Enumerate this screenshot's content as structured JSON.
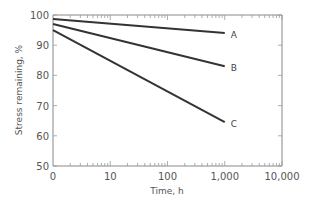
{
  "chart_data": {
    "type": "line",
    "title": "",
    "xlabel": "Time, h",
    "ylabel": "Stress remaining, %",
    "x_scale": "log",
    "x_tick_labels": [
      "0",
      "10",
      "100",
      "1,000",
      "10,000"
    ],
    "y_tick_labels": [
      "50",
      "60",
      "70",
      "80",
      "90",
      "100"
    ],
    "ylim": [
      50,
      100
    ],
    "grid": false,
    "legend": "inline labels at line ends",
    "series": [
      {
        "name": "A",
        "x": [
          1,
          1000
        ],
        "values": [
          98.7,
          94
        ]
      },
      {
        "name": "B",
        "x": [
          1,
          1000
        ],
        "values": [
          97,
          83
        ]
      },
      {
        "name": "C",
        "x": [
          1,
          1000
        ],
        "values": [
          95,
          64.5
        ]
      }
    ]
  }
}
